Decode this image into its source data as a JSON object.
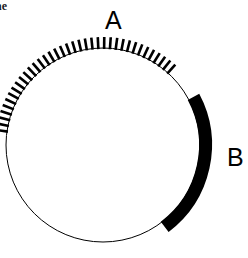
{
  "figure": {
    "type": "circular-arc-diagram",
    "width": 248,
    "height": 258,
    "background_color": "#ffffff",
    "stroke_color": "#000000",
    "clipped_caption": "he",
    "circle": {
      "center_x": 103,
      "center_y": 145,
      "radius": 97,
      "stroke_width": 1,
      "fill": "none"
    },
    "arcs": [
      {
        "id": "arc-a",
        "label": "A",
        "style": "hatched",
        "description": "radial tick hatching band on upper-left arc",
        "start_angle_deg": 188,
        "end_angle_deg": 312,
        "band_thickness": 11,
        "tick_count": 37,
        "tick_width": 2.6,
        "color": "#000000",
        "label_x": 105,
        "label_y": 8
      },
      {
        "id": "arc-b",
        "label": "B",
        "style": "solid",
        "description": "thick solid black arc on right side",
        "start_angle_deg": 332,
        "end_angle_deg": 53,
        "band_thickness": 13,
        "color": "#000000",
        "label_x": 227,
        "label_y": 145
      }
    ]
  },
  "chart_data": {
    "type": "pie",
    "title": "",
    "subtitle": "",
    "xlabel": "",
    "ylabel": "",
    "legend_position": "inline-outside",
    "grid": false,
    "categories": [
      "A",
      "B"
    ],
    "annotations": [
      "A",
      "B"
    ],
    "series": [
      {
        "name": "arc span (degrees)",
        "values": [
          124,
          81
        ]
      }
    ],
    "segments": [
      {
        "label": "A",
        "fill_style": "hatched",
        "start_angle_deg": 188,
        "end_angle_deg": 312,
        "span_deg": 124,
        "color": "#000000"
      },
      {
        "label": "B",
        "fill_style": "solid",
        "start_angle_deg": 332,
        "end_angle_deg": 53,
        "span_deg": 81,
        "color": "#000000"
      }
    ]
  }
}
